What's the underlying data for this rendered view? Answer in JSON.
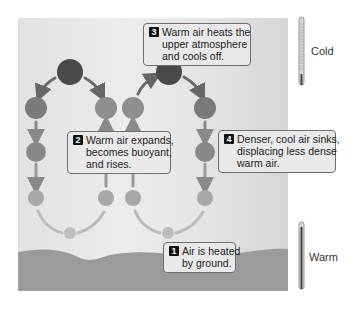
{
  "diagram": {
    "type": "convection-cycle",
    "colors": {
      "background": "#e6e6e6",
      "ground": "#9a9a9a",
      "cold_air": "#4a4a4a",
      "cool_air": "#7a7a7a",
      "mild_air": "#8e8e8e",
      "warm_air": "#a8a8a8",
      "hot_air": "#bdbdbd",
      "arrows": "#8a8a8a"
    },
    "callouts": [
      {
        "number": "1",
        "lines": [
          "Air is heated",
          "by ground."
        ]
      },
      {
        "number": "2",
        "lines": [
          "Warm air expands,",
          "becomes buoyant,",
          "and rises."
        ]
      },
      {
        "number": "3",
        "lines": [
          "Warm air heats the",
          "upper atmosphere",
          "and cools off."
        ]
      },
      {
        "number": "4",
        "lines": [
          "Denser, cool air sinks,",
          "displacing less dense",
          "warm air."
        ]
      }
    ],
    "thermometers": [
      {
        "label": "Cold",
        "icon": "thermometer-cold-icon"
      },
      {
        "label": "Warm",
        "icon": "thermometer-warm-icon"
      }
    ]
  }
}
